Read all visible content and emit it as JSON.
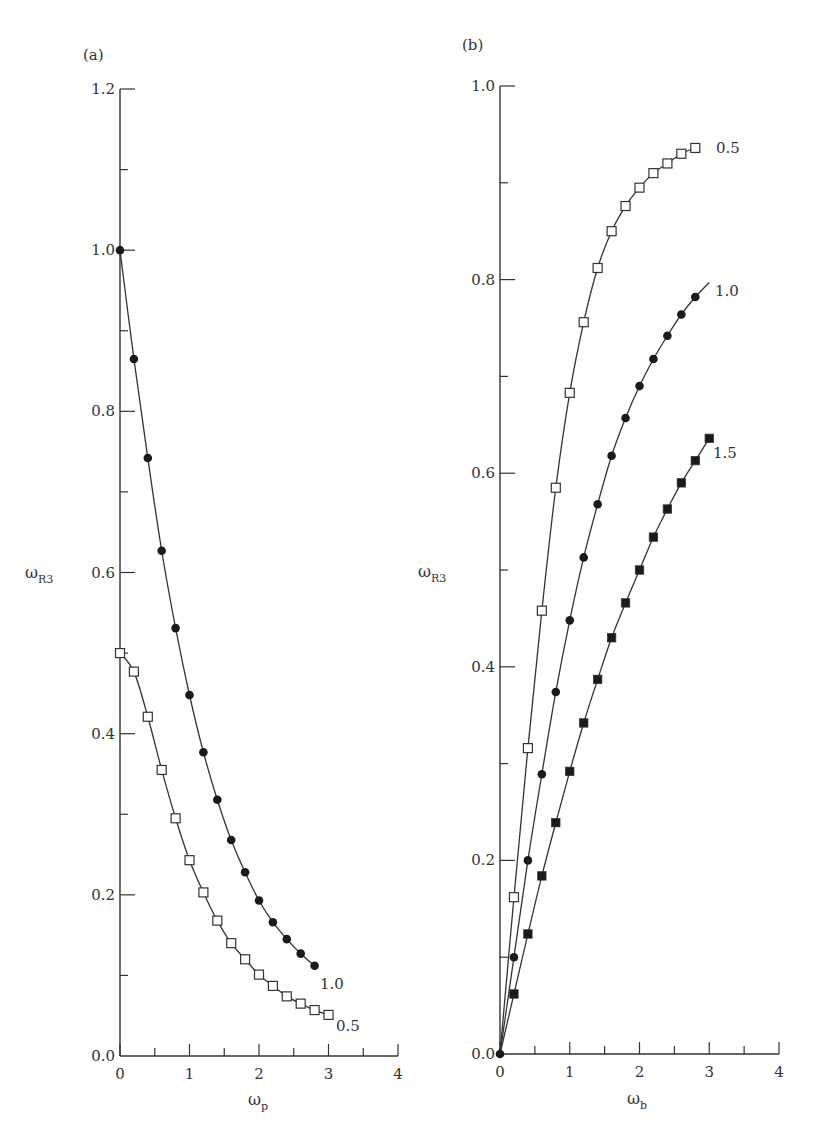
{
  "chart_data": [
    {
      "panel": "(a)",
      "type": "line",
      "title": "",
      "xlabel": "ω_p",
      "ylabel": "ω_R3",
      "xlim": [
        0,
        4
      ],
      "ylim": [
        0.0,
        1.2
      ],
      "x_ticks": [
        "0",
        "1",
        "2",
        "3",
        "4"
      ],
      "y_ticks": [
        "0.0",
        "0.2",
        "0.4",
        "0.6",
        "0.8",
        "1.0",
        "1.2"
      ],
      "grid": false,
      "legend": "inline curve labels",
      "series": [
        {
          "name": "1.0",
          "marker": "filled-circle",
          "x": [
            0,
            0.2,
            0.4,
            0.6,
            0.8,
            1.0,
            1.2,
            1.4,
            1.6,
            1.8,
            2.0,
            2.2,
            2.4,
            2.6,
            2.8
          ],
          "y": [
            1.0,
            0.865,
            0.742,
            0.627,
            0.531,
            0.448,
            0.377,
            0.318,
            0.268,
            0.228,
            0.193,
            0.166,
            0.145,
            0.127,
            0.112
          ]
        },
        {
          "name": "0.5",
          "marker": "open-square",
          "x": [
            0,
            0.2,
            0.4,
            0.6,
            0.8,
            1.0,
            1.2,
            1.4,
            1.6,
            1.8,
            2.0,
            2.2,
            2.4,
            2.6,
            2.8,
            3.0
          ],
          "y": [
            0.5,
            0.477,
            0.421,
            0.355,
            0.295,
            0.243,
            0.203,
            0.168,
            0.14,
            0.12,
            0.101,
            0.087,
            0.074,
            0.065,
            0.057,
            0.051
          ]
        }
      ]
    },
    {
      "panel": "(b)",
      "type": "line",
      "title": "",
      "xlabel": "ω_b",
      "ylabel": "ω_R3",
      "xlim": [
        0,
        4
      ],
      "ylim": [
        0.0,
        1.0
      ],
      "x_ticks": [
        "0",
        "1",
        "2",
        "3",
        "4"
      ],
      "y_ticks": [
        "0.0",
        "0.2",
        "0.4",
        "0.6",
        "0.8",
        "1.0"
      ],
      "grid": false,
      "legend": "inline curve labels",
      "series": [
        {
          "name": "0.5",
          "marker": "open-square",
          "x": [
            0,
            0.2,
            0.4,
            0.6,
            0.8,
            1.0,
            1.2,
            1.4,
            1.6,
            1.8,
            2.0,
            2.2,
            2.4,
            2.6,
            2.8
          ],
          "y": [
            0.0,
            0.162,
            0.316,
            0.458,
            0.585,
            0.683,
            0.756,
            0.812,
            0.85,
            0.876,
            0.895,
            0.91,
            0.92,
            0.93,
            0.936
          ]
        },
        {
          "name": "1.0",
          "marker": "filled-circle",
          "x": [
            0,
            0.2,
            0.4,
            0.6,
            0.8,
            1.0,
            1.2,
            1.4,
            1.6,
            1.8,
            2.0,
            2.2,
            2.4,
            2.6,
            2.8
          ],
          "y": [
            0.0,
            0.1,
            0.2,
            0.289,
            0.374,
            0.448,
            0.513,
            0.568,
            0.618,
            0.657,
            0.69,
            0.718,
            0.742,
            0.764,
            0.782
          ],
          "line_extends_to": [
            3.0,
            0.797
          ]
        },
        {
          "name": "1.5",
          "marker": "filled-square",
          "x": [
            0,
            0.2,
            0.4,
            0.6,
            0.8,
            1.0,
            1.2,
            1.4,
            1.6,
            1.8,
            2.0,
            2.2,
            2.4,
            2.6,
            2.8,
            3.0
          ],
          "y": [
            0.0,
            0.062,
            0.124,
            0.184,
            0.239,
            0.292,
            0.342,
            0.387,
            0.43,
            0.466,
            0.5,
            0.534,
            0.563,
            0.59,
            0.613,
            0.636
          ]
        }
      ]
    }
  ],
  "panels": {
    "a": {
      "label": "(a)",
      "ylabel_main": "ω",
      "ylabel_sub": "R3",
      "xlabel_main": "ω",
      "xlabel_sub": "p",
      "curve_labels": [
        "1.0",
        "0.5"
      ]
    },
    "b": {
      "label": "(b)",
      "ylabel_main": "ω",
      "ylabel_sub": "R3",
      "xlabel_main": "ω",
      "xlabel_sub": "b",
      "curve_labels": [
        "0.5",
        "1.0",
        "1.5"
      ]
    }
  },
  "colors": {
    "axis": "#333333",
    "line": "#333333",
    "marker_fill": "#1a1a1a",
    "marker_open": "#ffffff"
  }
}
